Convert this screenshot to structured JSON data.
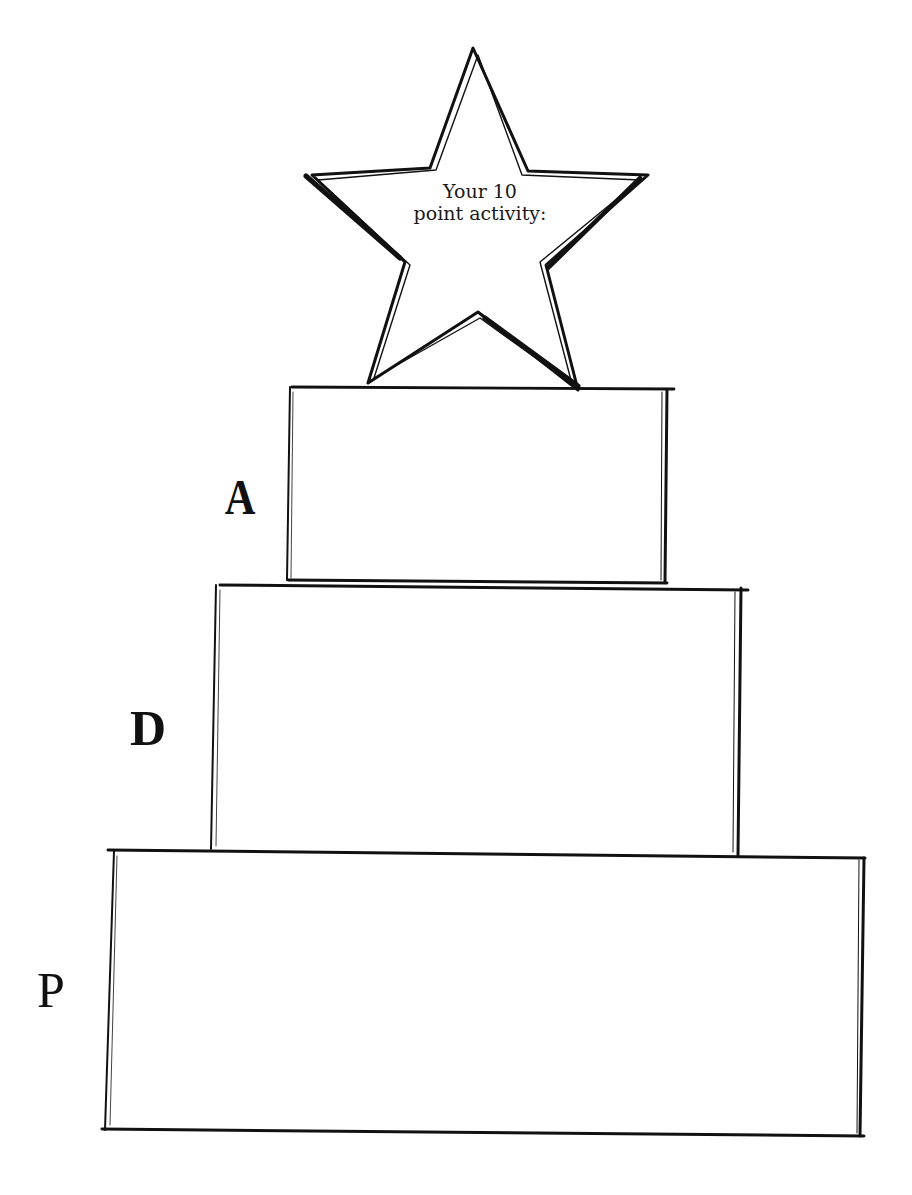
{
  "page": {
    "title_clipped": "",
    "background": "#ffffff",
    "ink_color": "#111111"
  },
  "star": {
    "line1": "Your 10",
    "line2": "point activity:"
  },
  "pyramid": {
    "levels": [
      {
        "letter": "A",
        "position": "top"
      },
      {
        "letter": "D",
        "position": "middle"
      },
      {
        "letter": "P",
        "position": "bottom"
      }
    ]
  }
}
